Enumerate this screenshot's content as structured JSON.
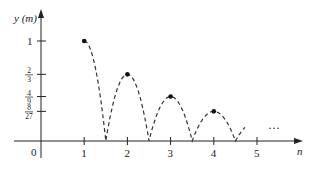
{
  "chart_data": {
    "type": "scatter",
    "title": "",
    "xlabel": "n",
    "ylabel": "y (m)",
    "origin_label": "0",
    "x_ticks": [
      "1",
      "2",
      "3",
      "4",
      "5"
    ],
    "y_ticks": [
      {
        "value": 1,
        "num": "1",
        "den": ""
      },
      {
        "value": 0.6667,
        "num": "2",
        "den": "3"
      },
      {
        "value": 0.4444,
        "num": "4",
        "den": "9"
      },
      {
        "value": 0.2963,
        "num": "8",
        "den": "27"
      }
    ],
    "points": [
      {
        "x": 1,
        "y": 1
      },
      {
        "x": 2,
        "y": 0.6667
      },
      {
        "x": 3,
        "y": 0.4444
      },
      {
        "x": 4,
        "y": 0.2963
      }
    ],
    "bounce_ground_contacts": [
      1.5,
      2.5,
      3.5,
      4.5
    ],
    "continuation": "…",
    "xlim": [
      0,
      5.5
    ],
    "ylim": [
      0,
      1.2
    ],
    "grid": false,
    "colors": {
      "axis": "#222222",
      "curve": "#333333",
      "point": "#111111"
    }
  }
}
